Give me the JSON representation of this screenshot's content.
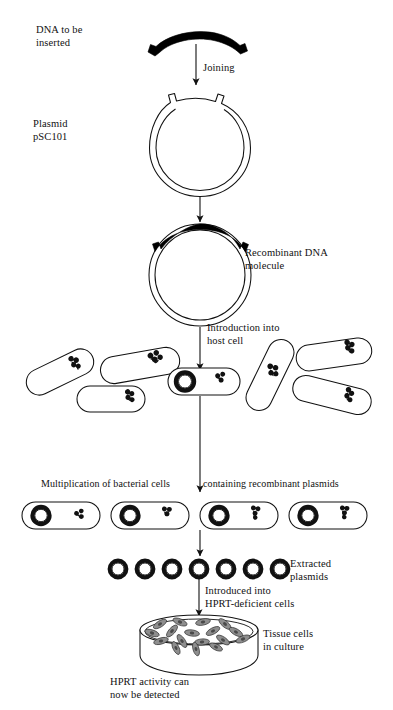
{
  "figure": {
    "colors": {
      "ink": "#111111",
      "insert_dna": "#000000",
      "cell_fill": "#ffffff",
      "tissue_cell_fill": "#8e8e8e",
      "background": "#ffffff"
    },
    "labels": {
      "dna_to_be_inserted": "DNA to be\ninserted",
      "joining": "Joining",
      "plasmid_psc101": "Plasmid\npSC101",
      "recombinant_dna_molecule": "Recombinant DNA\nmolecule",
      "introduction_into_host_cell": "Introduction into\nhost cell",
      "multiplication_of_bacterial_cells": "Multiplication of bacterial cells",
      "containing_recombinant_plasmids": "containing recombinant plasmids",
      "extracted_plasmids": "Extracted\nplasmids",
      "introduced_into_hprt_deficient_cells": "Introduced into\nHPRT-deficient cells",
      "tissue_cells_in_culture": "Tissue cells\nin culture",
      "hprt_activity_caption": "HPRT activity can\nnow be detected"
    },
    "steps": [
      {
        "id": "insert-dna",
        "label": "DNA to be inserted"
      },
      {
        "id": "joining",
        "label": "Joining"
      },
      {
        "id": "plasmid",
        "label": "Plasmid pSC101"
      },
      {
        "id": "recombinant",
        "label": "Recombinant DNA molecule"
      },
      {
        "id": "introduction",
        "label": "Introduction into host cell"
      },
      {
        "id": "multiplication",
        "label": "Multiplication of bacterial cells containing recombinant plasmids"
      },
      {
        "id": "extraction",
        "label": "Extracted plasmids"
      },
      {
        "id": "transfection",
        "label": "Introduced into HPRT-deficient cells"
      },
      {
        "id": "detection",
        "label": "HPRT activity can now be detected"
      }
    ],
    "counts": {
      "bacteria_population": 8,
      "bacteria_dividing_row": 4,
      "extracted_plasmids": 7,
      "tissue_cells": 17
    }
  }
}
